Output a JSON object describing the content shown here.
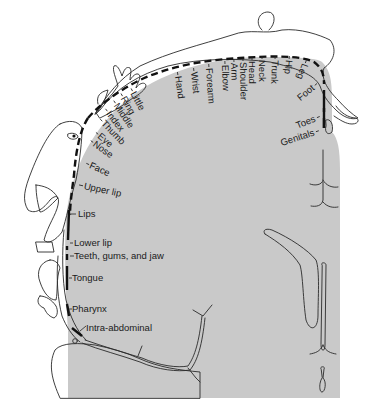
{
  "diagram": {
    "colors": {
      "cortex": "#c9c9c9",
      "background": "#ffffff",
      "ink": "#111111"
    },
    "labels": {
      "little": "Little",
      "ring": "Ring",
      "middle": "Middle",
      "index": "Index",
      "thumb": "Thumb",
      "eye": "Eye",
      "nose": "Nose",
      "face": "Face",
      "upper_lip": "Upper lip",
      "lips": "Lips",
      "lower_lip": "Lower lip",
      "teeth": "Teeth, gums, and jaw",
      "tongue": "Tongue",
      "pharynx": "Pharynx",
      "intra_abdominal": "Intra-abdominal",
      "hand": "Hand",
      "wrist": "Wrist",
      "forearm": "Forearm",
      "elbow": "Elbow",
      "arm": "Arm",
      "shoulder": "Shoulder",
      "head": "Head",
      "neck": "Neck",
      "trunk": "Trunk",
      "hip": "Hip",
      "leg": "Leg",
      "foot": "Foot",
      "toes": "Toes",
      "genitals": "Genitals"
    }
  }
}
